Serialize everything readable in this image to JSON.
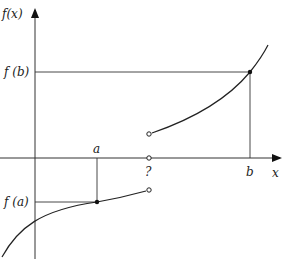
{
  "diagram": {
    "title": "",
    "axes": {
      "y_label": "f(x)",
      "x_label": "x",
      "origin": {
        "x": 35,
        "y": 158
      }
    },
    "labels": {
      "fb": "f (b)",
      "fa": "f (a)",
      "a": "a",
      "b": "b",
      "discontinuity": "?"
    },
    "points": {
      "a_point": {
        "x": 97,
        "y": 202,
        "filled": true
      },
      "b_point": {
        "x": 250,
        "y": 72,
        "filled": true
      },
      "open_upper": {
        "x": 149,
        "y": 134,
        "filled": false
      },
      "open_axis": {
        "x": 149,
        "y": 158,
        "filled": false
      },
      "open_lower": {
        "x": 149,
        "y": 190,
        "filled": false
      }
    },
    "colors": {
      "stroke": "#222222",
      "background": "#ffffff"
    }
  }
}
